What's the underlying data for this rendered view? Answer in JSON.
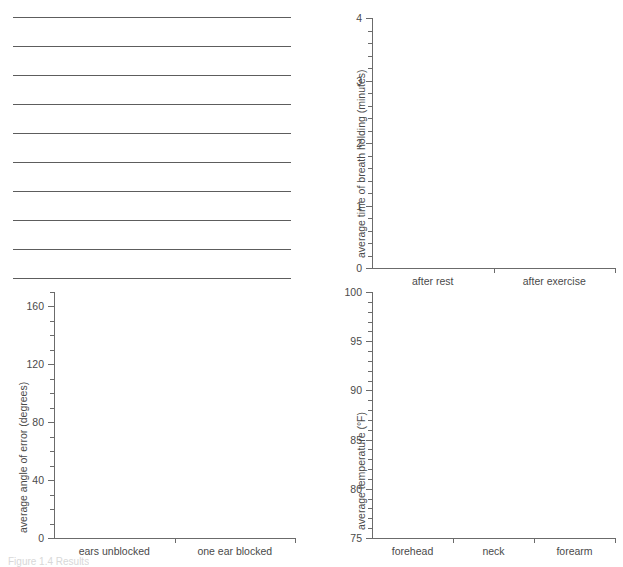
{
  "page": {
    "background_color": "#ffffff",
    "line_color": "#5d5d5d",
    "axis_color": "#6b6b6b",
    "text_color": "#4a4a4a",
    "caption": "Figure 1.4 Results"
  },
  "ruled_lines": {
    "name": "answer-writing-lines",
    "count": 10,
    "first_y": 17,
    "spacing": 29,
    "left": 13,
    "width": 278
  },
  "chart_data": [
    {
      "id": "breath-holding",
      "type": "bar",
      "title": "",
      "xlabel": "",
      "ylabel": "average time of breath holding (minutes)",
      "categories": [
        "after rest",
        "after exercise"
      ],
      "values": [],
      "ylim": [
        0,
        4
      ],
      "ymajor_step": 1,
      "yminor_step": 0.2,
      "ytick_labels": [
        "0",
        "1",
        "2",
        "3",
        "4"
      ],
      "grid": false,
      "legend": "none"
    },
    {
      "id": "angle-of-error",
      "type": "bar",
      "title": "",
      "xlabel": "",
      "ylabel": "average angle of error (degrees)",
      "categories": [
        "ears unblocked",
        "one ear blocked"
      ],
      "values": [],
      "ylim": [
        0,
        170
      ],
      "ymajor_step": 40,
      "yminor_step": 10,
      "ytick_labels": [
        "0",
        "40",
        "80",
        "120",
        "160"
      ],
      "grid": false,
      "legend": "none"
    },
    {
      "id": "body-temperature",
      "type": "bar",
      "title": "",
      "xlabel": "",
      "ylabel": "average temperature (°F)",
      "categories": [
        "forehead",
        "neck",
        "forearm"
      ],
      "values": [],
      "ylim": [
        75,
        100
      ],
      "ymajor_step": 5,
      "yminor_step": 1,
      "ytick_labels": [
        "75",
        "80",
        "85",
        "90",
        "95",
        "100"
      ],
      "grid": false,
      "legend": "none"
    }
  ]
}
